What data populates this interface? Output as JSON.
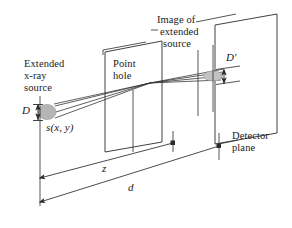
{
  "figure": {
    "background_color": "#ffffff",
    "line_color": "#2b2b2b",
    "source_fill": "#b3b3b3",
    "image_fill": "#c4c4c4",
    "width": 292,
    "height": 228
  },
  "labels": {
    "extended_source_line1": "Extended",
    "extended_source_line2": "x-ray",
    "extended_source_line3": "source",
    "point_hole_line1": "Point",
    "point_hole_line2": "hole",
    "image_of_line1": "Image of",
    "image_of_line2": "extended",
    "image_of_line3": "source",
    "detector_line1": "Detector",
    "detector_line2": "plane",
    "source_diameter": "D",
    "image_diameter": "D′",
    "source_function": "s(x, y)",
    "distance_z": "z",
    "distance_d": "d"
  },
  "geometry": {
    "source_center": [
      47,
      112
    ],
    "source_rx": 9,
    "source_ry": 7,
    "image_center": [
      213,
      78
    ],
    "image_rx": 9,
    "image_ry": 5,
    "pinhole_point": [
      150,
      96
    ],
    "pinhole_plane_corners": [
      [
        105,
        52
      ],
      [
        162,
        41
      ],
      [
        162,
        142
      ],
      [
        105,
        152
      ]
    ],
    "detector_plane_corners": [
      [
        215,
        25
      ],
      [
        277,
        14
      ],
      [
        277,
        133
      ],
      [
        215,
        144
      ]
    ],
    "ray_count": 3
  },
  "dimensions": {
    "z_label": "z",
    "z_start": [
      40,
      178
    ],
    "z_end": [
      173,
      143
    ],
    "d_label": "d",
    "d_start": [
      40,
      202
    ],
    "d_end": [
      219,
      146
    ]
  }
}
